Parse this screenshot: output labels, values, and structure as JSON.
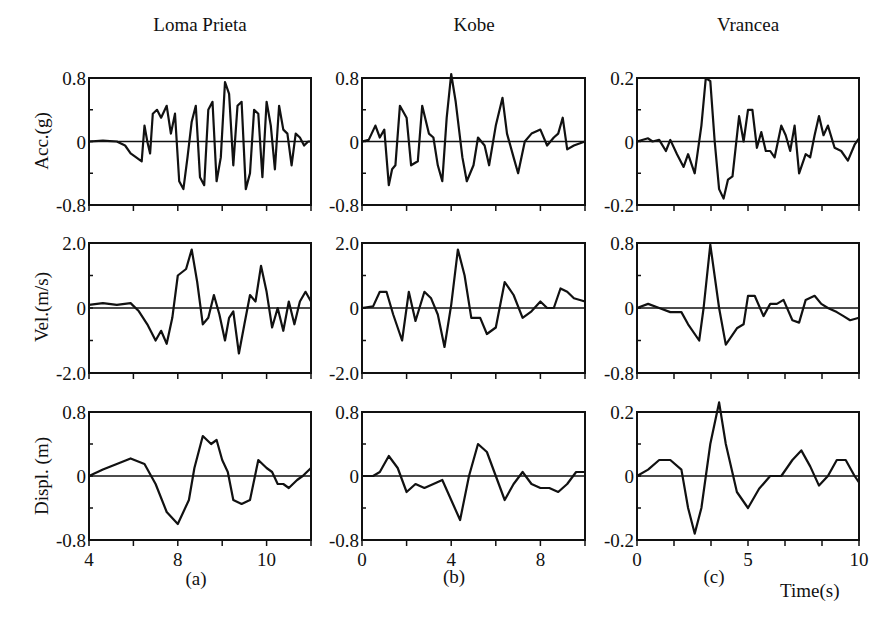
{
  "columns": [
    {
      "title": "Loma Prieta",
      "panel_label": "(a)",
      "x_ticks": [
        {
          "label": "4",
          "frac": 0.0
        },
        {
          "label": "8",
          "frac": 0.4
        },
        {
          "label": "10",
          "frac": 0.8
        }
      ],
      "x_tick_count": 6
    },
    {
      "title": "Kobe",
      "panel_label": "(b)",
      "x_ticks": [
        {
          "label": "0",
          "frac": 0.0
        },
        {
          "label": "4",
          "frac": 0.4
        },
        {
          "label": "8",
          "frac": 0.8
        }
      ],
      "x_tick_count": 6
    },
    {
      "title": "Vrancea",
      "panel_label": "(c)",
      "x_ticks": [
        {
          "label": "0",
          "frac": 0.0
        },
        {
          "label": "5",
          "frac": 0.5
        },
        {
          "label": "10",
          "frac": 1.0
        }
      ],
      "x_tick_count": 7
    }
  ],
  "rows": [
    {
      "ylabel": "Acc.(g)"
    },
    {
      "ylabel": "Vel.(m/s)"
    },
    {
      "ylabel": "Displ. (m)"
    }
  ],
  "x_unit_label": "Time(s)",
  "chart_data": [
    {
      "type": "line",
      "title": "Loma Prieta",
      "xlabel": "",
      "ylabel": "Acc.(g)",
      "ylim": [
        -0.8,
        0.8
      ],
      "yticks": [
        "0.8",
        "0",
        "-0.8"
      ],
      "xlim": [
        4,
        12
      ],
      "x": [
        4,
        4.5,
        5,
        5.3,
        5.5,
        5.7,
        5.9,
        6.0,
        6.1,
        6.2,
        6.3,
        6.45,
        6.6,
        6.8,
        6.95,
        7.1,
        7.25,
        7.4,
        7.55,
        7.7,
        7.85,
        8.0,
        8.15,
        8.3,
        8.45,
        8.6,
        8.75,
        8.9,
        9.05,
        9.2,
        9.35,
        9.5,
        9.65,
        9.8,
        9.95,
        10.1,
        10.25,
        10.4,
        10.55,
        10.7,
        10.85,
        11.0,
        11.15,
        11.3,
        11.45,
        11.6,
        11.75,
        11.9,
        12
      ],
      "values": [
        0,
        0.01,
        0.0,
        -0.05,
        -0.15,
        -0.2,
        -0.25,
        0.2,
        0.0,
        -0.15,
        0.35,
        0.4,
        0.3,
        0.45,
        0.1,
        0.35,
        -0.5,
        -0.6,
        -0.2,
        0.25,
        0.45,
        -0.45,
        -0.55,
        0.4,
        0.5,
        -0.5,
        -0.2,
        0.75,
        0.6,
        -0.3,
        0.45,
        0.5,
        -0.6,
        -0.4,
        0.4,
        0.35,
        -0.45,
        0.5,
        0.2,
        -0.35,
        0.45,
        0.15,
        0.1,
        -0.3,
        0.1,
        0.05,
        -0.05,
        0.0,
        0
      ]
    },
    {
      "type": "line",
      "title": "Kobe",
      "xlabel": "",
      "ylabel": "",
      "ylim": [
        -0.8,
        0.8
      ],
      "yticks": [
        "0.8",
        "0",
        "-0.8"
      ],
      "xlim": [
        0,
        10
      ],
      "x": [
        0,
        0.3,
        0.6,
        0.8,
        1.0,
        1.2,
        1.35,
        1.5,
        1.7,
        2.0,
        2.2,
        2.5,
        2.7,
        3.0,
        3.2,
        3.4,
        3.6,
        3.8,
        4.0,
        4.2,
        4.5,
        4.7,
        5.0,
        5.2,
        5.5,
        5.7,
        6.0,
        6.3,
        6.5,
        6.8,
        7.0,
        7.3,
        7.6,
        8.0,
        8.3,
        8.6,
        8.8,
        9.0,
        9.2,
        9.5,
        10
      ],
      "values": [
        0,
        0.02,
        0.2,
        0.05,
        0.15,
        -0.55,
        -0.35,
        -0.3,
        0.45,
        0.3,
        -0.3,
        -0.25,
        0.45,
        0.1,
        0.05,
        -0.3,
        -0.5,
        0.3,
        0.85,
        0.5,
        -0.2,
        -0.5,
        -0.3,
        0.05,
        -0.05,
        -0.3,
        0.2,
        0.55,
        0.1,
        -0.2,
        -0.4,
        0.0,
        0.1,
        0.15,
        -0.05,
        0.05,
        0.1,
        0.3,
        -0.1,
        -0.05,
        0
      ]
    },
    {
      "type": "line",
      "title": "Vrancea",
      "xlabel": "Time(s)",
      "ylabel": "",
      "ylim": [
        -0.2,
        0.2
      ],
      "yticks": [
        "0.2",
        "0",
        "-0.2"
      ],
      "xlim": [
        0,
        10
      ],
      "x": [
        0,
        0.5,
        0.7,
        1.0,
        1.3,
        1.5,
        1.8,
        2.1,
        2.3,
        2.6,
        2.9,
        3.1,
        3.3,
        3.5,
        3.7,
        3.9,
        4.1,
        4.3,
        4.6,
        4.8,
        5.0,
        5.2,
        5.4,
        5.6,
        5.8,
        6.0,
        6.2,
        6.5,
        6.7,
        6.9,
        7.1,
        7.3,
        7.6,
        7.8,
        8.0,
        8.2,
        8.4,
        8.6,
        8.9,
        9.2,
        9.5,
        9.8,
        10
      ],
      "values": [
        0,
        0.01,
        0.0,
        0.005,
        -0.03,
        0.005,
        -0.04,
        -0.08,
        -0.04,
        -0.1,
        0.05,
        0.2,
        0.19,
        0.0,
        -0.15,
        -0.18,
        -0.12,
        -0.11,
        0.08,
        0.0,
        0.1,
        0.1,
        -0.02,
        0.03,
        -0.03,
        -0.03,
        -0.05,
        0.05,
        0.02,
        -0.03,
        0.05,
        -0.1,
        -0.04,
        -0.05,
        0.02,
        0.08,
        0.02,
        0.05,
        -0.02,
        -0.03,
        -0.06,
        -0.01,
        0.01
      ]
    },
    {
      "type": "line",
      "title": "Loma Prieta",
      "xlabel": "",
      "ylabel": "Vel.(m/s)",
      "ylim": [
        -2.0,
        2.0
      ],
      "yticks": [
        "2.0",
        "0",
        "-2.0"
      ],
      "xlim": [
        4,
        12
      ],
      "x": [
        4,
        4.5,
        5,
        5.5,
        5.8,
        6.1,
        6.4,
        6.6,
        6.8,
        7.0,
        7.2,
        7.5,
        7.7,
        7.9,
        8.1,
        8.3,
        8.5,
        8.7,
        8.9,
        9.05,
        9.2,
        9.4,
        9.6,
        9.8,
        10.0,
        10.2,
        10.4,
        10.6,
        10.8,
        11.0,
        11.2,
        11.4,
        11.6,
        11.8,
        12
      ],
      "values": [
        0.1,
        0.15,
        0.1,
        0.15,
        -0.1,
        -0.5,
        -1.0,
        -0.7,
        -1.1,
        -0.3,
        1.0,
        1.2,
        1.8,
        0.8,
        -0.5,
        -0.3,
        0.4,
        -0.2,
        -1.0,
        -0.3,
        -0.1,
        -1.4,
        -0.5,
        0.4,
        0.2,
        1.3,
        0.5,
        -0.6,
        0.0,
        -0.7,
        0.2,
        -0.5,
        0.2,
        0.5,
        0.2
      ]
    },
    {
      "type": "line",
      "title": "Kobe",
      "xlabel": "",
      "ylabel": "",
      "ylim": [
        -2.0,
        2.0
      ],
      "yticks": [
        "2.0",
        "0",
        "-2.0"
      ],
      "xlim": [
        0,
        10
      ],
      "x": [
        0,
        0.5,
        0.8,
        1.1,
        1.4,
        1.8,
        2.1,
        2.4,
        2.8,
        3.1,
        3.4,
        3.7,
        4.0,
        4.3,
        4.6,
        4.9,
        5.3,
        5.6,
        6.0,
        6.4,
        6.8,
        7.2,
        7.6,
        8.0,
        8.3,
        8.6,
        8.9,
        9.2,
        9.5,
        10
      ],
      "values": [
        0,
        0.05,
        0.5,
        0.5,
        -0.2,
        -1.0,
        0.5,
        -0.4,
        0.5,
        0.3,
        -0.2,
        -1.2,
        0.1,
        1.8,
        1.0,
        -0.3,
        -0.3,
        -0.8,
        -0.6,
        0.8,
        0.4,
        -0.3,
        -0.1,
        0.2,
        0.0,
        0.0,
        0.6,
        0.5,
        0.3,
        0.2
      ]
    },
    {
      "type": "line",
      "title": "Vrancea",
      "xlabel": "",
      "ylabel": "",
      "ylim": [
        -0.8,
        0.8
      ],
      "yticks": [
        "0.8",
        "0",
        "-0.8"
      ],
      "xlim": [
        0,
        10
      ],
      "x": [
        0,
        0.5,
        1.0,
        1.5,
        2.0,
        2.3,
        2.8,
        3.0,
        3.3,
        3.7,
        4.0,
        4.5,
        4.8,
        5.0,
        5.3,
        5.7,
        6.0,
        6.3,
        6.6,
        7.0,
        7.3,
        7.6,
        8.0,
        8.3,
        8.6,
        9.0,
        9.3,
        9.6,
        10
      ],
      "values": [
        0,
        0.05,
        0.0,
        -0.05,
        -0.05,
        -0.2,
        -0.4,
        0.0,
        0.78,
        0.0,
        -0.45,
        -0.25,
        -0.2,
        0.15,
        0.15,
        -0.1,
        0.05,
        0.05,
        0.1,
        -0.15,
        -0.18,
        0.1,
        0.15,
        0.05,
        0.0,
        -0.05,
        -0.1,
        -0.15,
        -0.12
      ]
    },
    {
      "type": "line",
      "title": "Loma Prieta",
      "xlabel": "",
      "ylabel": "Displ. (m)",
      "ylim": [
        -0.8,
        0.8
      ],
      "yticks": [
        "0.8",
        "0",
        "-0.8"
      ],
      "xlim": [
        4,
        12
      ],
      "x": [
        4,
        4.5,
        5.0,
        5.5,
        6.0,
        6.4,
        6.8,
        7.2,
        7.6,
        7.8,
        8.1,
        8.4,
        8.6,
        8.8,
        9.0,
        9.2,
        9.5,
        9.8,
        10.1,
        10.4,
        10.6,
        10.8,
        11.0,
        11.2,
        11.5,
        11.7,
        12
      ],
      "values": [
        0,
        0.08,
        0.15,
        0.22,
        0.15,
        -0.1,
        -0.45,
        -0.6,
        -0.3,
        0.1,
        0.5,
        0.4,
        0.45,
        0.2,
        0.05,
        -0.3,
        -0.35,
        -0.3,
        0.2,
        0.1,
        0.05,
        -0.1,
        -0.1,
        -0.15,
        -0.05,
        0.0,
        0.1
      ]
    },
    {
      "type": "line",
      "title": "Kobe",
      "xlabel": "",
      "ylabel": "",
      "ylim": [
        -0.8,
        0.8
      ],
      "yticks": [
        "0.8",
        "0",
        "-0.8"
      ],
      "xlim": [
        0,
        10
      ],
      "x": [
        0,
        0.5,
        0.8,
        1.2,
        1.6,
        2.0,
        2.4,
        2.8,
        3.2,
        3.6,
        4.0,
        4.4,
        4.8,
        5.2,
        5.6,
        6.0,
        6.4,
        6.8,
        7.2,
        7.6,
        8.0,
        8.4,
        8.8,
        9.2,
        9.6,
        10
      ],
      "values": [
        0,
        0.0,
        0.05,
        0.25,
        0.1,
        -0.2,
        -0.1,
        -0.15,
        -0.1,
        -0.05,
        -0.3,
        -0.55,
        0.0,
        0.4,
        0.3,
        0.0,
        -0.3,
        -0.1,
        0.05,
        -0.1,
        -0.15,
        -0.15,
        -0.2,
        -0.1,
        0.05,
        0.05
      ]
    },
    {
      "type": "line",
      "title": "Vrancea",
      "xlabel": "Time(s)",
      "ylabel": "",
      "ylim": [
        -0.2,
        0.2
      ],
      "yticks": [
        "0.2",
        "0",
        "-0.2"
      ],
      "xlim": [
        0,
        10
      ],
      "x": [
        0,
        0.5,
        1.0,
        1.5,
        2.0,
        2.3,
        2.6,
        2.9,
        3.3,
        3.7,
        4.0,
        4.5,
        5.0,
        5.5,
        6.0,
        6.5,
        7.0,
        7.4,
        7.8,
        8.2,
        8.6,
        9.0,
        9.4,
        9.8,
        10
      ],
      "values": [
        0,
        0.02,
        0.05,
        0.05,
        0.02,
        -0.1,
        -0.18,
        -0.1,
        0.1,
        0.23,
        0.1,
        -0.05,
        -0.1,
        -0.04,
        0.0,
        0.0,
        0.05,
        0.08,
        0.03,
        -0.03,
        0.0,
        0.05,
        0.05,
        0.0,
        -0.02
      ]
    }
  ]
}
